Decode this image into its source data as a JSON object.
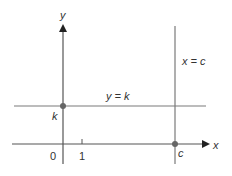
{
  "diagram": {
    "colors": {
      "axis": "#555555",
      "line": "#7a7a7a",
      "point": "#666666",
      "text": "#333333"
    },
    "axes": {
      "x_label": "x",
      "y_label": "y",
      "origin_label": "0",
      "tick_label": "1"
    },
    "lines": {
      "horizontal": {
        "label": "y = k",
        "intercept_label": "k"
      },
      "vertical": {
        "label": "x = c",
        "intercept_label": "c"
      }
    }
  }
}
